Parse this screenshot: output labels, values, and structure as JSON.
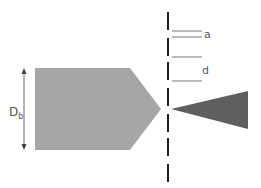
{
  "diagram": {
    "labels": {
      "a": "a",
      "d": "d",
      "diameter_main": "D",
      "diameter_sub": "b"
    },
    "colors": {
      "body": "#a6a6a6",
      "cone": "#5f5f5f",
      "line": "#222222",
      "thin": "#555555"
    }
  }
}
